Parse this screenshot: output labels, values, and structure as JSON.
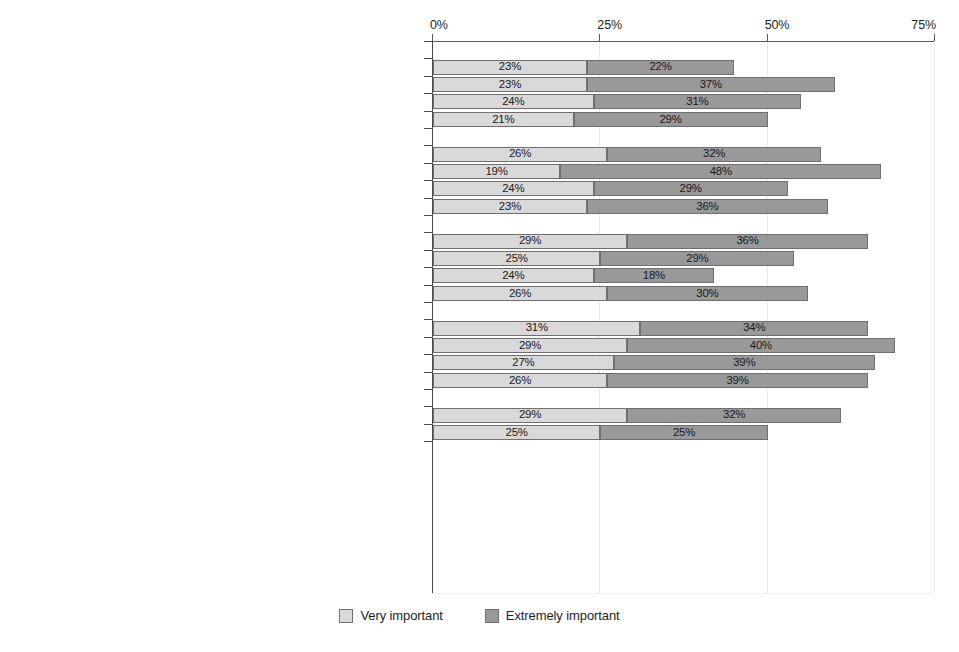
{
  "chart_data": {
    "type": "bar",
    "subtype": "stacked-horizontal-grouped",
    "title": "",
    "xlabel": "",
    "ylabel": "",
    "xlim": [
      0,
      75
    ],
    "xticks": [
      0,
      25,
      50,
      75
    ],
    "xticklabels": [
      "0%",
      "25%",
      "50%",
      "75%"
    ],
    "grid": true,
    "legend_position": "bottom-center",
    "series": [
      {
        "name": "Very important",
        "color": "#d9d9d9"
      },
      {
        "name": "Extremely important",
        "color": "#999999"
      }
    ],
    "groups": [
      {
        "title": "1. Maintaining high incomes for their members",
        "rows": [
          {
            "label": "Medical associations",
            "very_important": 23,
            "extremely_important": 22,
            "very_important_text": "23%",
            "extremely_important_text": "22%"
          },
          {
            "label": "Unions",
            "very_important": 23,
            "extremely_important": 37,
            "very_important_text": "23%",
            "extremely_important_text": "37%"
          },
          {
            "label": "Business orgs.",
            "very_important": 24,
            "extremely_important": 31,
            "very_important_text": "24%",
            "extremely_important_text": "31%"
          },
          {
            "label": "Health insurance",
            "very_important": 21,
            "extremely_important": 29,
            "very_important_text": "21%",
            "extremely_important_text": "29%"
          }
        ]
      },
      {
        "title": "2. Preserving the influence their group has over policy makers",
        "rows": [
          {
            "label": "Medical associations",
            "very_important": 26,
            "extremely_important": 32,
            "very_important_text": "26%",
            "extremely_important_text": "32%"
          },
          {
            "label": "Unions",
            "very_important": 19,
            "extremely_important": 48,
            "very_important_text": "19%",
            "extremely_important_text": "48%"
          },
          {
            "label": "Business orgs.",
            "very_important": 24,
            "extremely_important": 29,
            "very_important_text": "24%",
            "extremely_important_text": "29%"
          },
          {
            "label": "Health insurance",
            "very_important": 23,
            "extremely_important": 36,
            "very_important_text": "23%",
            "extremely_important_text": "36%"
          }
        ]
      },
      {
        "title": "3. Promoting [patient/worker] health",
        "rows": [
          {
            "label": "Medical associations",
            "very_important": 29,
            "extremely_important": 36,
            "very_important_text": "29%",
            "extremely_important_text": "36%"
          },
          {
            "label": "Unions",
            "very_important": 25,
            "extremely_important": 29,
            "very_important_text": "25%",
            "extremely_important_text": "29%"
          },
          {
            "label": "Business orgs.",
            "very_important": 24,
            "extremely_important": 18,
            "very_important_text": "24%",
            "extremely_important_text": "18%"
          },
          {
            "label": "Health insurance",
            "very_important": 26,
            "extremely_important": 30,
            "very_important_text": "26%",
            "extremely_important_text": "30%"
          }
        ]
      },
      {
        "title": "4. Ensuring that new laws and regulations help their industry",
        "rows": [
          {
            "label": "Medical associations",
            "very_important": 31,
            "extremely_important": 34,
            "very_important_text": "31%",
            "extremely_important_text": "34%"
          },
          {
            "label": "Unions",
            "very_important": 29,
            "extremely_important": 40,
            "very_important_text": "29%",
            "extremely_important_text": "40%"
          },
          {
            "label": "Business orgs.",
            "very_important": 27,
            "extremely_important": 39,
            "very_important_text": "27%",
            "extremely_important_text": "39%"
          },
          {
            "label": "Health insurance",
            "very_important": 26,
            "extremely_important": 39,
            "very_important_text": "26%",
            "extremely_important_text": "39%"
          }
        ]
      },
      {
        "title": "5. Protecting doctors from malpractice suits",
        "rows": [
          {
            "label": "Medical associations",
            "very_important": 29,
            "extremely_important": 32,
            "very_important_text": "29%",
            "extremely_important_text": "32%"
          },
          {
            "label": "Health insurance",
            "very_important": 25,
            "extremely_important": 25,
            "very_important_text": "25%",
            "extremely_important_text": "25%"
          }
        ]
      }
    ]
  },
  "legend": {
    "items": [
      {
        "label": "Very important",
        "color": "#d9d9d9"
      },
      {
        "label": "Extremely important",
        "color": "#999999"
      }
    ]
  }
}
